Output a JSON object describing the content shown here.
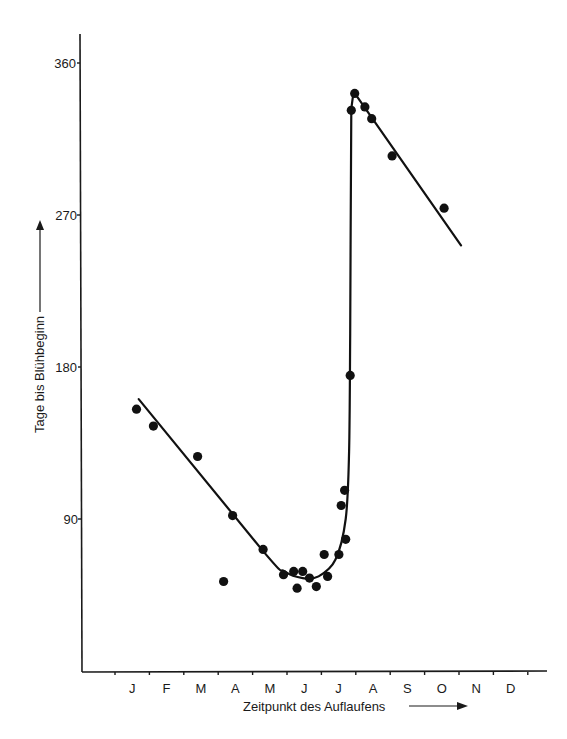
{
  "chart_data": {
    "type": "scatter",
    "title": "",
    "xlabel": "Zeitpunkt des Auflaufens",
    "ylabel": "Tage bis Blühbeginn",
    "x_unit": "day of year (month ticks)",
    "xticks": [
      "J",
      "F",
      "M",
      "A",
      "M",
      "J",
      "J",
      "A",
      "S",
      "O",
      "N",
      "D"
    ],
    "yticks": [
      90,
      180,
      270,
      360
    ],
    "ylim": [
      0,
      365
    ],
    "xlim": [
      0,
      365
    ],
    "grid": false,
    "legend": null,
    "series": [
      {
        "name": "Beobachtungen",
        "kind": "points",
        "points": [
          {
            "x": 19,
            "y": 155
          },
          {
            "x": 34,
            "y": 145
          },
          {
            "x": 73,
            "y": 127
          },
          {
            "x": 96,
            "y": 53
          },
          {
            "x": 104,
            "y": 92
          },
          {
            "x": 131,
            "y": 72
          },
          {
            "x": 149,
            "y": 57
          },
          {
            "x": 158,
            "y": 59
          },
          {
            "x": 161,
            "y": 49
          },
          {
            "x": 166,
            "y": 59
          },
          {
            "x": 172,
            "y": 55
          },
          {
            "x": 178,
            "y": 50
          },
          {
            "x": 185,
            "y": 69
          },
          {
            "x": 188,
            "y": 56
          },
          {
            "x": 198,
            "y": 69
          },
          {
            "x": 200,
            "y": 98
          },
          {
            "x": 203,
            "y": 107
          },
          {
            "x": 204,
            "y": 78
          },
          {
            "x": 208,
            "y": 175
          },
          {
            "x": 209,
            "y": 332
          },
          {
            "x": 212,
            "y": 342
          },
          {
            "x": 221,
            "y": 334
          },
          {
            "x": 227,
            "y": 327
          },
          {
            "x": 245,
            "y": 305
          },
          {
            "x": 291,
            "y": 274
          }
        ]
      },
      {
        "name": "Ausgleichskurve",
        "kind": "line",
        "points": [
          {
            "x": 21,
            "y": 161
          },
          {
            "x": 131,
            "y": 71
          },
          {
            "x": 150,
            "y": 59
          },
          {
            "x": 166,
            "y": 55
          },
          {
            "x": 180,
            "y": 56
          },
          {
            "x": 195,
            "y": 66
          },
          {
            "x": 204,
            "y": 90
          },
          {
            "x": 207,
            "y": 130
          },
          {
            "x": 208,
            "y": 200
          },
          {
            "x": 209,
            "y": 333
          },
          {
            "x": 211,
            "y": 343
          },
          {
            "x": 306,
            "y": 252
          }
        ]
      }
    ]
  },
  "axes": {
    "y_label": "Tage bis Blühbeginn",
    "x_label": "Zeitpunkt des Auflaufens",
    "y_ticks": [
      "90",
      "180",
      "270",
      "360"
    ],
    "x_months": [
      "J",
      "F",
      "M",
      "A",
      "M",
      "J",
      "J",
      "A",
      "S",
      "O",
      "N",
      "D"
    ]
  }
}
